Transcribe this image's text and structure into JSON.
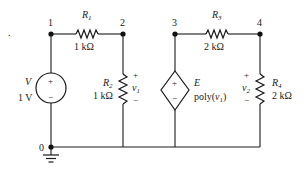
{
  "diagram": {
    "type": "circuit-schematic",
    "nodes": [
      {
        "id": "1",
        "label": "1"
      },
      {
        "id": "2",
        "label": "2"
      },
      {
        "id": "3",
        "label": "3"
      },
      {
        "id": "4",
        "label": "4"
      },
      {
        "id": "0",
        "label": "0"
      }
    ],
    "components": {
      "r1": {
        "name": "R",
        "sub": "1",
        "value": "1 kΩ",
        "from": "1",
        "to": "2"
      },
      "r2": {
        "name": "R",
        "sub": "2",
        "value": "1 kΩ",
        "from": "2",
        "to": "0"
      },
      "r3": {
        "name": "R",
        "sub": "3",
        "value": "2 kΩ",
        "from": "3",
        "to": "4"
      },
      "r4": {
        "name": "R",
        "sub": "4",
        "value": "2 kΩ",
        "from": "4",
        "to": "0"
      },
      "v": {
        "name": "V",
        "value": "1 V",
        "plus": "+",
        "minus": "−",
        "from": "1",
        "to": "0"
      },
      "e": {
        "name": "E",
        "value_prefix": "poly(",
        "value_var": "v",
        "value_sub": "1",
        "value_suffix": ")",
        "plus": "+",
        "minus": "−",
        "from": "3",
        "to": "0"
      }
    },
    "voltages": {
      "v1": {
        "name": "v",
        "sub": "1",
        "plus": "+",
        "minus": "−",
        "across": "r2"
      },
      "v2": {
        "name": "v",
        "sub": "2",
        "plus": "+",
        "minus": "−",
        "across": "r4"
      }
    },
    "stray_mark": "."
  }
}
